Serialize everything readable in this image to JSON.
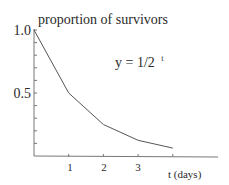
{
  "chart_data": {
    "type": "line",
    "title": "",
    "ylabel": "proportion of survivors",
    "xlabel": "t (days)",
    "annotation": "y = 1/2",
    "annotation_exponent": "t",
    "x": [
      0,
      1,
      2,
      3,
      4
    ],
    "values": [
      1.0,
      0.5,
      0.25,
      0.125,
      0.0625
    ],
    "series": [
      {
        "name": "y = 1/2^t",
        "x": [
          0,
          1,
          2,
          3,
          4
        ],
        "values": [
          1.0,
          0.5,
          0.25,
          0.125,
          0.0625
        ]
      }
    ],
    "xticks": [
      1,
      2,
      3,
      4
    ],
    "xtick_labels": [
      "1",
      "2",
      "3",
      ""
    ],
    "yticks_labeled": [
      0.5,
      1.0
    ],
    "ytick_labels": [
      "0.5",
      "1.0"
    ],
    "yminor_ticks": [
      0.1,
      0.2,
      0.3,
      0.4,
      0.6,
      0.7,
      0.8,
      0.9
    ],
    "xlim": [
      0,
      5.3
    ],
    "ylim": [
      0,
      1.0
    ],
    "grid": false,
    "legend": "none",
    "line_color": "#555555",
    "axis_color": "#777777"
  }
}
